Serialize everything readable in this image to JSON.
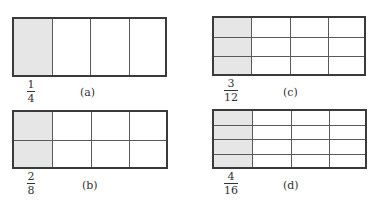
{
  "figure": {
    "panels": [
      {
        "id": "a",
        "label": "(a)",
        "rows": 1,
        "cols": 4,
        "shaded_cols": 1,
        "fraction": {
          "numerator": "1",
          "denominator": "4"
        },
        "box": {
          "x": 12,
          "y": 17,
          "w": 155,
          "h": 60
        },
        "fraction_pos": {
          "x": 19,
          "y": 79
        },
        "label_pos": {
          "x": 80,
          "y": 86
        }
      },
      {
        "id": "c",
        "label": "(c)",
        "rows": 3,
        "cols": 4,
        "shaded_cols": 1,
        "fraction": {
          "numerator": "3",
          "denominator": "12"
        },
        "box": {
          "x": 212,
          "y": 16,
          "w": 154,
          "h": 60
        },
        "fraction_pos": {
          "x": 219,
          "y": 78
        },
        "label_pos": {
          "x": 283,
          "y": 86
        }
      },
      {
        "id": "b",
        "label": "(b)",
        "rows": 2,
        "cols": 4,
        "shaded_cols": 1,
        "fraction": {
          "numerator": "2",
          "denominator": "8"
        },
        "box": {
          "x": 12,
          "y": 110,
          "w": 156,
          "h": 59
        },
        "fraction_pos": {
          "x": 19,
          "y": 171
        },
        "label_pos": {
          "x": 82,
          "y": 179
        }
      },
      {
        "id": "d",
        "label": "(d)",
        "rows": 4,
        "cols": 4,
        "shaded_cols": 1,
        "fraction": {
          "numerator": "4",
          "denominator": "16"
        },
        "box": {
          "x": 212,
          "y": 109,
          "w": 155,
          "h": 60
        },
        "fraction_pos": {
          "x": 219,
          "y": 171
        },
        "label_pos": {
          "x": 283,
          "y": 179
        }
      }
    ],
    "colors": {
      "shade": "#e6e6e6",
      "border": "#3a3a3a",
      "divider": "#5a5a5a",
      "text": "#333333"
    }
  }
}
